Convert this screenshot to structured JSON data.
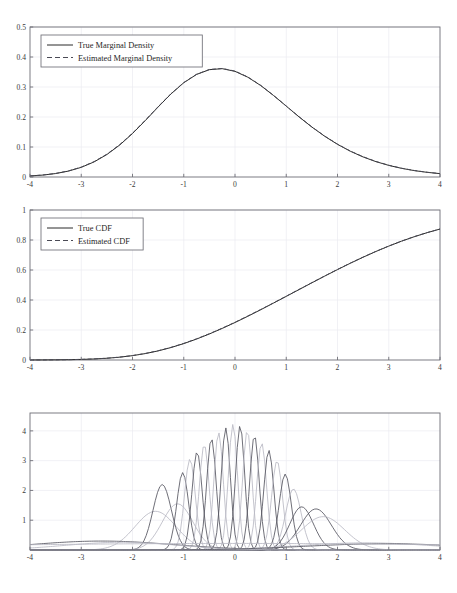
{
  "page": {
    "header_faint_text": "",
    "background": "#ffffff"
  },
  "colors": {
    "axis": "#6e6e76",
    "grid": "#ebebf0",
    "true_curve": "#2b2b2b",
    "estimated_curve": "#4a4a55",
    "component_dark": "#555560",
    "component_light": "#b9b9c4",
    "tick_text": "#3a3a3a"
  },
  "chart_data": [
    {
      "id": "marginal-density",
      "type": "line",
      "title": "",
      "xlabel": "",
      "ylabel": "",
      "xlim": [
        -4,
        4
      ],
      "ylim": [
        0,
        0.5
      ],
      "xticks": [
        -4,
        -3,
        -2,
        -1,
        0,
        1,
        2,
        3,
        4
      ],
      "xticklabels": [
        "-4",
        "-3",
        "-2",
        "-1",
        "0",
        "1",
        "2",
        "3",
        "4"
      ],
      "yticks": [
        0,
        0.1,
        0.2,
        0.3,
        0.4,
        0.5
      ],
      "yticklabels": [
        "0",
        "0.1",
        "0.2",
        "0.3",
        "0.4",
        "0.5"
      ],
      "grid": true,
      "legend_position": "upper-left",
      "legend": [
        "True Marginal Density",
        "Estimated Marginal Density"
      ],
      "series": [
        {
          "name": "True Marginal Density",
          "style": "solid",
          "color": "#2b2b2b",
          "x": [
            -4,
            -3.75,
            -3.5,
            -3.25,
            -3,
            -2.75,
            -2.5,
            -2.25,
            -2,
            -1.75,
            -1.5,
            -1.25,
            -1,
            -0.75,
            -0.5,
            -0.25,
            0,
            0.25,
            0.5,
            0.75,
            1,
            1.25,
            1.5,
            1.75,
            2,
            2.25,
            2.5,
            2.75,
            3,
            3.25,
            3.5,
            3.75,
            4
          ],
          "values": [
            0.0034,
            0.0064,
            0.0115,
            0.0197,
            0.0322,
            0.0503,
            0.0749,
            0.1066,
            0.1449,
            0.1881,
            0.2334,
            0.2768,
            0.3142,
            0.3419,
            0.3578,
            0.3611,
            0.3522,
            0.3327,
            0.3051,
            0.2719,
            0.2362,
            0.2004,
            0.1665,
            0.1358,
            0.1089,
            0.0859,
            0.0668,
            0.0512,
            0.0387,
            0.0289,
            0.0213,
            0.0155,
            0.0112
          ]
        },
        {
          "name": "Estimated Marginal Density",
          "style": "dashed",
          "color": "#4a4a55",
          "x": [
            -4,
            -3.75,
            -3.5,
            -3.25,
            -3,
            -2.75,
            -2.5,
            -2.25,
            -2,
            -1.75,
            -1.5,
            -1.25,
            -1,
            -0.75,
            -0.5,
            -0.25,
            0,
            0.25,
            0.5,
            0.75,
            1,
            1.25,
            1.5,
            1.75,
            2,
            2.25,
            2.5,
            2.75,
            3,
            3.25,
            3.5,
            3.75,
            4
          ],
          "values": [
            0.0036,
            0.0067,
            0.0119,
            0.0203,
            0.033,
            0.0512,
            0.076,
            0.1078,
            0.1461,
            0.1893,
            0.2344,
            0.2775,
            0.3148,
            0.3424,
            0.3584,
            0.3618,
            0.353,
            0.3334,
            0.3057,
            0.2724,
            0.2366,
            0.2008,
            0.167,
            0.1364,
            0.1096,
            0.0866,
            0.0675,
            0.0518,
            0.0392,
            0.0293,
            0.0216,
            0.0158,
            0.0114
          ]
        }
      ]
    },
    {
      "id": "cdf",
      "type": "line",
      "title": "",
      "xlabel": "",
      "ylabel": "",
      "xlim": [
        -4,
        4
      ],
      "ylim": [
        0,
        1
      ],
      "xticks": [
        -4,
        -3,
        -2,
        -1,
        0,
        1,
        2,
        3,
        4
      ],
      "xticklabels": [
        "-4",
        "-3",
        "-2",
        "-1",
        "0",
        "1",
        "2",
        "3",
        "4"
      ],
      "yticks": [
        0,
        0.2,
        0.4,
        0.6,
        0.8,
        1
      ],
      "yticklabels": [
        "0",
        "0.2",
        "0.4",
        "0.6",
        "0.8",
        "1"
      ],
      "grid": true,
      "legend_position": "upper-left",
      "legend": [
        "True CDF",
        "Estimated CDF"
      ],
      "series": [
        {
          "name": "True CDF",
          "style": "solid",
          "color": "#2b2b2b",
          "x": [
            -4,
            -3.75,
            -3.5,
            -3.25,
            -3,
            -2.75,
            -2.5,
            -2.25,
            -2,
            -1.75,
            -1.5,
            -1.25,
            -1,
            -0.75,
            -0.5,
            -0.25,
            0,
            0.25,
            0.5,
            0.75,
            1,
            1.25,
            1.5,
            1.75,
            2,
            2.25,
            2.5,
            2.75,
            3,
            3.25,
            3.5,
            3.75,
            4
          ],
          "values": [
            0.0002,
            0.0005,
            0.0011,
            0.0021,
            0.0039,
            0.0069,
            0.0116,
            0.0188,
            0.029,
            0.0428,
            0.0607,
            0.0829,
            0.1093,
            0.1397,
            0.1736,
            0.2105,
            0.25,
            0.2916,
            0.3348,
            0.3792,
            0.4242,
            0.4695,
            0.5146,
            0.5592,
            0.6028,
            0.645,
            0.6854,
            0.7236,
            0.7593,
            0.7922,
            0.8222,
            0.8491,
            0.873
          ]
        },
        {
          "name": "Estimated CDF",
          "style": "dashed",
          "color": "#4a4a55",
          "x": [
            -4,
            -3.75,
            -3.5,
            -3.25,
            -3,
            -2.75,
            -2.5,
            -2.25,
            -2,
            -1.75,
            -1.5,
            -1.25,
            -1,
            -0.75,
            -0.5,
            -0.25,
            0,
            0.25,
            0.5,
            0.75,
            1,
            1.25,
            1.5,
            1.75,
            2,
            2.25,
            2.5,
            2.75,
            3,
            3.25,
            3.5,
            3.75,
            4
          ],
          "values": [
            0.0002,
            0.0005,
            0.0012,
            0.0022,
            0.0041,
            0.0072,
            0.012,
            0.0193,
            0.0297,
            0.0437,
            0.0618,
            0.0842,
            0.1107,
            0.1412,
            0.1752,
            0.2121,
            0.2516,
            0.2932,
            0.3364,
            0.3807,
            0.4257,
            0.4709,
            0.5159,
            0.5604,
            0.6039,
            0.646,
            0.6862,
            0.7243,
            0.7599,
            0.7927,
            0.8226,
            0.8494,
            0.8732
          ]
        }
      ]
    },
    {
      "id": "mixture-components",
      "type": "line",
      "title": "",
      "xlabel": "",
      "ylabel": "",
      "xlim": [
        -4,
        4
      ],
      "ylim": [
        0,
        4.6
      ],
      "xticks": [
        -4,
        -3,
        -2,
        -1,
        0,
        1,
        2,
        3,
        4
      ],
      "xticklabels": [
        "-4",
        "-3",
        "-2",
        "-1",
        "0",
        "1",
        "2",
        "3",
        "4"
      ],
      "yticks": [
        1,
        2,
        3,
        4
      ],
      "yticklabels": [
        "1",
        "2",
        "3",
        "4"
      ],
      "grid": true,
      "legend_position": "none",
      "legend": [],
      "note": "Overlaid conditional / component densities of varying width and height",
      "components": [
        {
          "mu": -1.55,
          "sigma": 0.4,
          "peak": 1.3,
          "shade": "light"
        },
        {
          "mu": -1.42,
          "sigma": 0.18,
          "peak": 2.2,
          "shade": "dark"
        },
        {
          "mu": -1.12,
          "sigma": 0.3,
          "peak": 1.55,
          "shade": "light"
        },
        {
          "mu": -1.02,
          "sigma": 0.115,
          "peak": 2.6,
          "shade": "dark"
        },
        {
          "mu": -0.88,
          "sigma": 0.105,
          "peak": 3.05,
          "shade": "light"
        },
        {
          "mu": -0.74,
          "sigma": 0.098,
          "peak": 3.3,
          "shade": "dark"
        },
        {
          "mu": -0.6,
          "sigma": 0.095,
          "peak": 3.55,
          "shade": "light"
        },
        {
          "mu": -0.46,
          "sigma": 0.092,
          "peak": 3.75,
          "shade": "dark"
        },
        {
          "mu": -0.32,
          "sigma": 0.09,
          "peak": 3.95,
          "shade": "light"
        },
        {
          "mu": -0.18,
          "sigma": 0.089,
          "peak": 4.1,
          "shade": "dark"
        },
        {
          "mu": -0.04,
          "sigma": 0.088,
          "peak": 4.22,
          "shade": "light"
        },
        {
          "mu": 0.1,
          "sigma": 0.089,
          "peak": 4.18,
          "shade": "dark"
        },
        {
          "mu": 0.24,
          "sigma": 0.09,
          "peak": 4.02,
          "shade": "light"
        },
        {
          "mu": 0.38,
          "sigma": 0.092,
          "peak": 3.85,
          "shade": "dark"
        },
        {
          "mu": 0.52,
          "sigma": 0.095,
          "peak": 3.6,
          "shade": "light"
        },
        {
          "mu": 0.66,
          "sigma": 0.098,
          "peak": 3.35,
          "shade": "dark"
        },
        {
          "mu": 0.82,
          "sigma": 0.105,
          "peak": 3.0,
          "shade": "light"
        },
        {
          "mu": 0.98,
          "sigma": 0.118,
          "peak": 2.55,
          "shade": "dark"
        },
        {
          "mu": 1.14,
          "sigma": 0.15,
          "peak": 2.05,
          "shade": "light"
        },
        {
          "mu": 1.3,
          "sigma": 0.23,
          "peak": 1.45,
          "shade": "dark"
        },
        {
          "mu": 1.58,
          "sigma": 0.3,
          "peak": 1.38,
          "shade": "dark"
        },
        {
          "mu": 1.72,
          "sigma": 0.42,
          "peak": 1.12,
          "shade": "light"
        },
        {
          "mu": -2.6,
          "sigma": 1.4,
          "peak": 0.3,
          "shade": "dark"
        },
        {
          "mu": -2.2,
          "sigma": 1.1,
          "peak": 0.26,
          "shade": "light"
        },
        {
          "mu": 2.55,
          "sigma": 1.3,
          "peak": 0.24,
          "shade": "light"
        },
        {
          "mu": 2.95,
          "sigma": 1.55,
          "peak": 0.21,
          "shade": "dark"
        },
        {
          "mu": 0.0,
          "sigma": 6.0,
          "peak": 0.22,
          "shade": "light"
        }
      ]
    }
  ]
}
